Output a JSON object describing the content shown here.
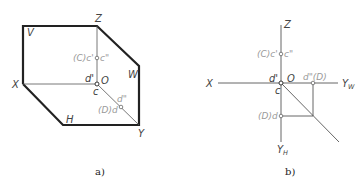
{
  "figure_a": {
    "caption": "a)",
    "axes": {
      "x": "X",
      "y": "Y",
      "z": "Z",
      "origin": "O"
    },
    "planes": {
      "v": "V",
      "w": "W",
      "h": "H"
    },
    "points": {
      "c_label_left": "(C)c'",
      "c_label_right": "c\"",
      "d_prime": "d'",
      "c_lower": "c",
      "d_double": "d\"",
      "d_label": "(D)d"
    }
  },
  "figure_b": {
    "caption": "b)",
    "axes": {
      "x": "X",
      "z": "Z",
      "origin": "O",
      "yw": "Y",
      "yw_sub": "W",
      "yh": "Y",
      "yh_sub": "H"
    },
    "points": {
      "c_label_left": "(C)c'",
      "c_label_right": "c\"",
      "d_prime": "d'",
      "c_lower": "c",
      "d_double_label": "d\"(D)",
      "d_label": "(D)d"
    }
  },
  "colors": {
    "line": "#222222",
    "thin": "#555555",
    "label_gray": "#9a9a9a"
  }
}
